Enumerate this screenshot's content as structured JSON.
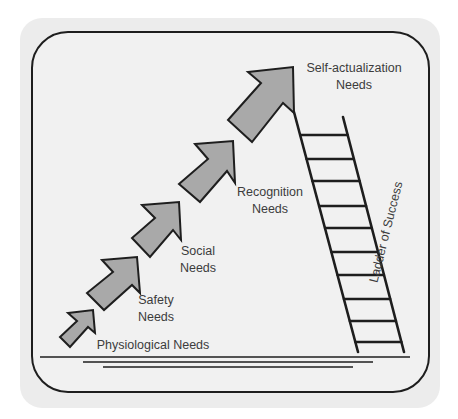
{
  "diagram": {
    "colors": {
      "page_background": "#ffffff",
      "panel_background": "#ececec",
      "frame_stroke": "#1e1e1e",
      "arrow_fill": "#a9a9a9",
      "arrow_stroke": "#1e1e1e",
      "text": "#3c3c3c"
    },
    "steps": [
      {
        "level": 1,
        "line1": "Physiological Needs",
        "line2": ""
      },
      {
        "level": 2,
        "line1": "Safety",
        "line2": "Needs"
      },
      {
        "level": 3,
        "line1": "Social",
        "line2": "Needs"
      },
      {
        "level": 4,
        "line1": "Recognition",
        "line2": "Needs"
      },
      {
        "level": 5,
        "line1": "Self-actualization",
        "line2": "Needs"
      }
    ],
    "ladder": {
      "label": "Ladder of Success",
      "rung_count": 10
    },
    "ground_lines": 3
  }
}
